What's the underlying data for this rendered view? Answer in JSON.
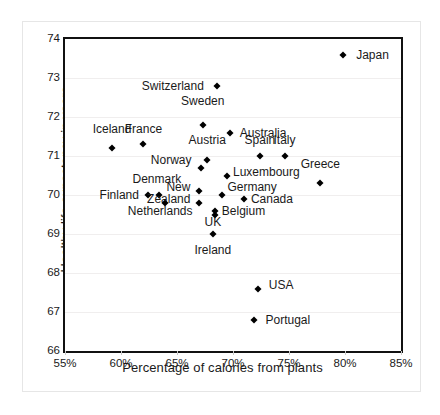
{
  "chart_data": {
    "type": "scatter",
    "title": "",
    "xlabel": "Percentage of calories from plants",
    "ylabel": "Healthy life expectancy in years",
    "xlim": [
      55,
      85
    ],
    "ylim": [
      66,
      74
    ],
    "xticks": [
      "55%",
      "60%",
      "65%",
      "70%",
      "75%",
      "80%",
      "85%"
    ],
    "xtick_values": [
      55,
      60,
      65,
      70,
      75,
      80,
      85
    ],
    "yticks": [
      "66",
      "67",
      "68",
      "69",
      "70",
      "71",
      "72",
      "73",
      "74"
    ],
    "ytick_values": [
      66,
      67,
      68,
      69,
      70,
      71,
      72,
      73,
      74
    ],
    "grid": "horizontal",
    "legend": "none",
    "marker": "diamond",
    "marker_color": "#000000",
    "points": [
      {
        "label": "Japan",
        "x": 79.8,
        "y": 73.6,
        "lx": 81.0,
        "ly": 73.6,
        "anchor": "left"
      },
      {
        "label": "Switzerland",
        "x": 68.6,
        "y": 72.8,
        "lx": 67.4,
        "ly": 72.8,
        "anchor": "right"
      },
      {
        "label": "Sweden",
        "x": 67.3,
        "y": 71.8,
        "lx": 67.3,
        "ly": 72.4,
        "anchor": "mid"
      },
      {
        "label": "Australia",
        "x": 69.7,
        "y": 71.6,
        "lx": 70.6,
        "ly": 71.6,
        "anchor": "left"
      },
      {
        "label": "Iceland",
        "x": 59.2,
        "y": 71.2,
        "lx": 59.2,
        "ly": 71.7,
        "anchor": "mid"
      },
      {
        "label": "France",
        "x": 62.0,
        "y": 71.3,
        "lx": 62.0,
        "ly": 71.7,
        "anchor": "mid"
      },
      {
        "label": "Austria",
        "x": 67.7,
        "y": 70.9,
        "lx": 67.7,
        "ly": 71.4,
        "anchor": "mid"
      },
      {
        "label": "Italy",
        "x": 74.6,
        "y": 71.0,
        "lx": 74.6,
        "ly": 71.4,
        "anchor": "mid"
      },
      {
        "label": "Spain",
        "x": 72.4,
        "y": 71.0,
        "lx": 72.4,
        "ly": 71.4,
        "anchor": "mid"
      },
      {
        "label": "Norway",
        "x": 67.1,
        "y": 70.7,
        "lx": 66.3,
        "ly": 70.9,
        "anchor": "right"
      },
      {
        "label": "Luxembourg",
        "x": 69.5,
        "y": 70.5,
        "lx": 70.0,
        "ly": 70.6,
        "anchor": "left"
      },
      {
        "label": "Greece",
        "x": 77.8,
        "y": 70.3,
        "lx": 77.8,
        "ly": 70.8,
        "anchor": "mid"
      },
      {
        "label": "Denmark",
        "x": 63.4,
        "y": 70.0,
        "lx": 63.2,
        "ly": 70.4,
        "anchor": "mid"
      },
      {
        "label": "New",
        "x": 67.0,
        "y": 70.1,
        "lx": 66.2,
        "ly": 70.2,
        "anchor": "right"
      },
      {
        "label": "Germany",
        "x": 69.0,
        "y": 70.0,
        "lx": 69.5,
        "ly": 70.2,
        "anchor": "left"
      },
      {
        "label": "Finland",
        "x": 62.4,
        "y": 70.0,
        "lx": 61.6,
        "ly": 70.0,
        "anchor": "right"
      },
      {
        "label": "Zealand",
        "x": 67.0,
        "y": 69.8,
        "lx": 66.2,
        "ly": 69.9,
        "anchor": "right"
      },
      {
        "label": "Canada",
        "x": 71.0,
        "y": 69.9,
        "lx": 71.6,
        "ly": 69.9,
        "anchor": "left"
      },
      {
        "label": "Netherlands",
        "x": 63.9,
        "y": 69.8,
        "lx": 63.5,
        "ly": 69.6,
        "anchor": "mid"
      },
      {
        "label": "Belgium",
        "x": 68.4,
        "y": 69.6,
        "lx": 69.0,
        "ly": 69.6,
        "anchor": "left"
      },
      {
        "label": "UK",
        "x": 68.4,
        "y": 69.5,
        "lx": 68.2,
        "ly": 69.3,
        "anchor": "mid"
      },
      {
        "label": "Ireland",
        "x": 68.2,
        "y": 69.0,
        "lx": 68.2,
        "ly": 68.6,
        "anchor": "mid"
      },
      {
        "label": "USA",
        "x": 72.2,
        "y": 67.6,
        "lx": 73.2,
        "ly": 67.7,
        "anchor": "left"
      },
      {
        "label": "Portugal",
        "x": 71.9,
        "y": 66.8,
        "lx": 72.9,
        "ly": 66.8,
        "anchor": "left"
      }
    ]
  }
}
